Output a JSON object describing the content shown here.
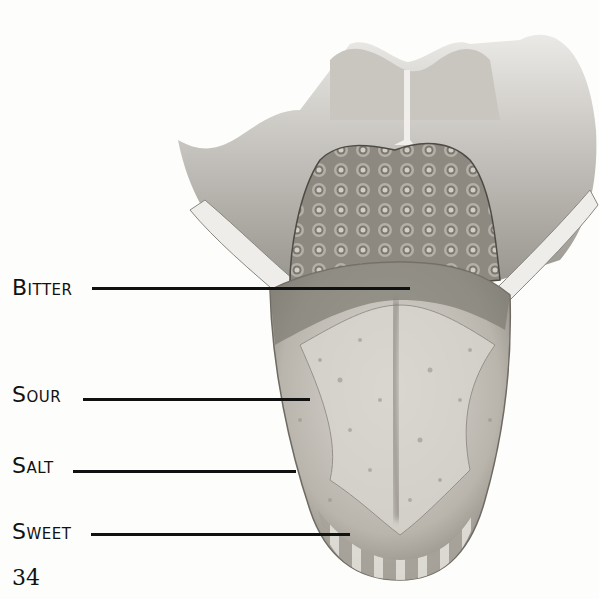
{
  "diagram": {
    "colors": {
      "background": "#fdfdfb",
      "ink": "#111111",
      "tongue_light": "#d6d3cd",
      "tongue_mid": "#a9a59d",
      "tongue_dark": "#6f6b64",
      "papillae": "#8c8880"
    },
    "labels": [
      {
        "id": "bitter",
        "text": "Bitter",
        "x": 12,
        "y": 278,
        "line_x1": 92,
        "line_x2": 410,
        "line_y": 288
      },
      {
        "id": "sour",
        "text": "Sour",
        "x": 12,
        "y": 385,
        "line_x1": 83,
        "line_x2": 310,
        "line_y": 399
      },
      {
        "id": "salt",
        "text": "Salt",
        "x": 12,
        "y": 455,
        "line_x1": 73,
        "line_x2": 296,
        "line_y": 471
      },
      {
        "id": "sweet",
        "text": "Sweet",
        "x": 12,
        "y": 521,
        "line_x1": 91,
        "line_x2": 350,
        "line_y": 534
      }
    ],
    "page_number": "34"
  }
}
